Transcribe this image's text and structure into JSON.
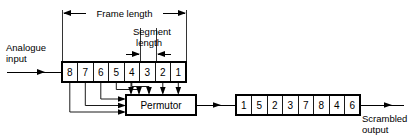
{
  "diagram": {
    "labels": {
      "frame_length": "Frame  length",
      "segment_length_line1": "Segment",
      "segment_length_line2": "length",
      "analogue_input_line1": "Analogue",
      "analogue_input_line2": "input",
      "permutor": "Permutor",
      "scrambled_output_line1": "Scrambled",
      "scrambled_output_line2": "output"
    },
    "input_register": {
      "name": "input-frame-register",
      "cells": [
        "8",
        "7",
        "6",
        "5",
        "4",
        "3",
        "2",
        "1"
      ]
    },
    "output_register": {
      "name": "scrambled-output-register",
      "cells": [
        "1",
        "5",
        "2",
        "3",
        "7",
        "8",
        "4",
        "6"
      ]
    },
    "colors": {
      "ink": "#000000",
      "paper": "#ffffff"
    }
  }
}
